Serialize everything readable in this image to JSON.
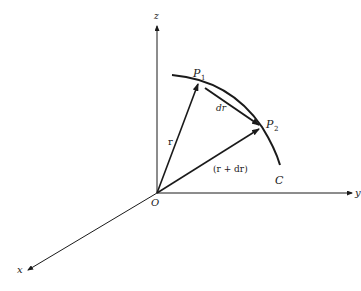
{
  "diagram": {
    "type": "vector-geometry",
    "colors": {
      "ink": "#1a1a1a",
      "background": "#ffffff"
    },
    "axes": {
      "z": {
        "label": "z"
      },
      "y": {
        "label": "y"
      },
      "x": {
        "label": "x"
      },
      "origin": {
        "label": "O"
      }
    },
    "curve": {
      "label": "C"
    },
    "points": {
      "p1": {
        "label": "P",
        "sub": "1"
      },
      "p2": {
        "label": "P",
        "sub": "2"
      }
    },
    "vectors": {
      "r": {
        "label": "r"
      },
      "dr": {
        "label": "dr"
      },
      "r_plus_dr": {
        "label": "(r + dr)"
      }
    }
  }
}
